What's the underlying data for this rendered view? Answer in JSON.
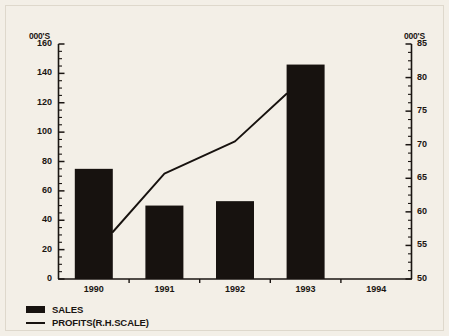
{
  "chart_data": {
    "type": "bar",
    "title": "",
    "xlabel": "",
    "ylabel": "000'S",
    "categories": [
      "1990",
      "1991",
      "1992",
      "1993",
      "1994"
    ],
    "series": [
      {
        "name": "SALES",
        "type": "bar",
        "axis": "left",
        "values": [
          75,
          50,
          53,
          146,
          null
        ]
      },
      {
        "name": "PROFITS(R.H.SCALE)",
        "type": "line",
        "axis": "right",
        "values": [
          57.0,
          65.7,
          70.5,
          77.6,
          null
        ]
      }
    ],
    "left_axis": {
      "label": "000'S",
      "ticks": [
        0,
        20,
        40,
        60,
        80,
        100,
        120,
        140,
        160
      ],
      "ylim": [
        0,
        160
      ],
      "minor_ticks": true
    },
    "right_axis": {
      "label": "000'S",
      "ticks": [
        50,
        55,
        60,
        65,
        70,
        75,
        80,
        85
      ],
      "ylim": [
        50,
        85
      ],
      "minor_ticks": true
    },
    "grid": false,
    "legend_position": "bottom-left",
    "colors": {
      "bar": "#17120f",
      "line": "#17120f",
      "axis": "#1a1512",
      "background": "#f3efe7"
    }
  },
  "legend": {
    "items": [
      {
        "label": "SALES",
        "marker": "filled-bar-swatch"
      },
      {
        "label": "PROFITS(R.H.SCALE)",
        "marker": "line-swatch"
      }
    ]
  }
}
